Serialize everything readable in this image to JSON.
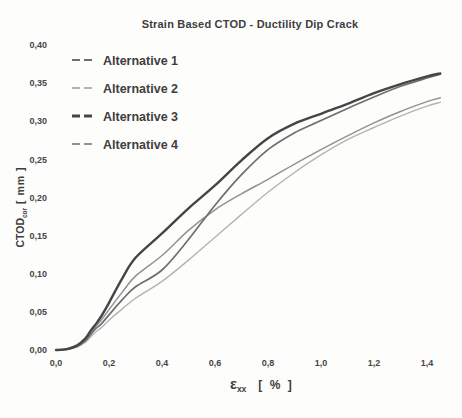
{
  "figure": {
    "background": "#fdfdfc",
    "text_color": "#3e3e3e"
  },
  "chart_data": {
    "type": "line",
    "title": "Strain Based CTOD - Ductility Dip Crack",
    "xlabel": {
      "main": "ε",
      "sub": "xx",
      "units": "[ % ]"
    },
    "ylabel": {
      "main": "CTOD",
      "sub": "cor",
      "units": "[ mm ]"
    },
    "xlim": [
      0.0,
      1.45
    ],
    "ylim": [
      0.0,
      0.4
    ],
    "grid": false,
    "axis_lines_visible": false,
    "legend_position": "top-left",
    "x_ticks": {
      "values": [
        0.0,
        0.2,
        0.4,
        0.6,
        0.8,
        1.0,
        1.2,
        1.4
      ],
      "labels": [
        "0,0",
        "0,2",
        "0,4",
        "0,6",
        "0,8",
        "1,0",
        "1,2",
        "1,4"
      ]
    },
    "y_ticks": {
      "values": [
        0.0,
        0.05,
        0.1,
        0.15,
        0.2,
        0.25,
        0.3,
        0.35,
        0.4
      ],
      "labels": [
        "0,00",
        "0,05",
        "0,10",
        "0,15",
        "0,20",
        "0,25",
        "0,30",
        "0,35",
        "0,40"
      ]
    },
    "x": [
      0,
      0.04,
      0.08,
      0.11,
      0.13,
      0.15,
      0.17,
      0.2,
      0.25,
      0.3,
      0.4,
      0.5,
      0.6,
      0.7,
      0.8,
      0.9,
      1.0,
      1.1,
      1.2,
      1.3,
      1.4,
      1.45
    ],
    "series": [
      {
        "name": "Alternative 1",
        "color": "#6e6e6e",
        "width": 1.7,
        "values": [
          0,
          0.001,
          0.005,
          0.012,
          0.02,
          0.028,
          0.034,
          0.046,
          0.066,
          0.083,
          0.105,
          0.145,
          0.19,
          0.23,
          0.263,
          0.285,
          0.301,
          0.317,
          0.332,
          0.346,
          0.357,
          0.362
        ]
      },
      {
        "name": "Alternative 2",
        "color": "#b3b3b3",
        "width": 1.4,
        "values": [
          0,
          0.001,
          0.004,
          0.01,
          0.017,
          0.024,
          0.029,
          0.039,
          0.054,
          0.068,
          0.09,
          0.118,
          0.148,
          0.178,
          0.207,
          0.233,
          0.256,
          0.276,
          0.292,
          0.307,
          0.32,
          0.325
        ]
      },
      {
        "name": "Alternative 3",
        "color": "#454545",
        "width": 2.4,
        "values": [
          0,
          0.001,
          0.006,
          0.015,
          0.025,
          0.034,
          0.044,
          0.062,
          0.094,
          0.121,
          0.153,
          0.186,
          0.216,
          0.249,
          0.278,
          0.297,
          0.31,
          0.323,
          0.337,
          0.349,
          0.359,
          0.363
        ]
      },
      {
        "name": "Alternative 4",
        "color": "#929292",
        "width": 1.5,
        "values": [
          0,
          0.001,
          0.005,
          0.013,
          0.022,
          0.031,
          0.039,
          0.053,
          0.076,
          0.097,
          0.124,
          0.157,
          0.184,
          0.205,
          0.224,
          0.244,
          0.263,
          0.281,
          0.298,
          0.313,
          0.326,
          0.331
        ]
      }
    ]
  }
}
